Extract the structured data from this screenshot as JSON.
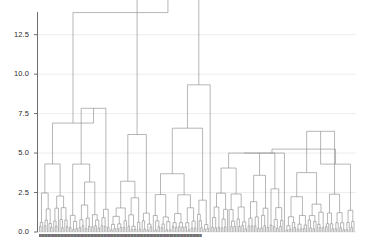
{
  "chart_data": {
    "type": "dendrogram",
    "title": "",
    "xlabel": "",
    "ylabel": "",
    "ylim": [
      0,
      14.3
    ],
    "grid": true,
    "yticks": [
      0.0,
      2.5,
      5.0,
      7.5,
      10.0,
      12.5
    ],
    "ytick_labels": [
      "0.0",
      "2.5",
      "5.0",
      "7.5",
      "10.0",
      "12.5"
    ],
    "line_color": "#8a8a8a",
    "grid_color": "#ededed",
    "axis_color": "#6d6d6d",
    "tick_label_color": "#2b2b2b",
    "background": "#ffffff",
    "leaf_count": 200,
    "leaf_labels_legible": false,
    "leaf_label_band_text": "IIIIIIIIIIIIIIIIIIIIIIIIIIIIIIIIIIIIIIIIIIIIIIIIIIIIIIIIIIIIIIIIIIIIIIIIIIIIIIIIIIIIIIIIIIIIIIIIIIIIIIIIIIIIIIIIIIIIIIIIIIIIIIIIIIIIIIIIIIIIIIIIIIIIIIIIIIIIIIIIIIIIIIIIIIIIIIIIIIIIIIIIIIIIIIIIIIIIIIIII",
    "root_height": 13.9,
    "clusters": [
      {
        "name": "left-cluster",
        "leaf_start": 0,
        "leaf_end": 44,
        "top_merge": 6.9
      },
      {
        "name": "center-cluster",
        "leaf_start": 45,
        "leaf_end": 108,
        "top_merge": 13.3
      },
      {
        "name": "right-cluster-a",
        "leaf_start": 109,
        "leaf_end": 155,
        "top_merge": 5.0
      },
      {
        "name": "right-cluster-b",
        "leaf_start": 156,
        "leaf_end": 199,
        "top_merge": 4.3
      }
    ],
    "merges": [
      {
        "x1": 0.5,
        "x2": 56.0,
        "height": 13.9
      },
      {
        "x1": 47.0,
        "x2": 65.0,
        "height": 13.3
      },
      {
        "x1": 0.5,
        "x2": 20.0,
        "height": 6.9
      },
      {
        "x1": 108.0,
        "x2": 175.0,
        "height": 5.0
      },
      {
        "x1": 152.0,
        "x2": 190.0,
        "height": 4.3
      }
    ]
  }
}
